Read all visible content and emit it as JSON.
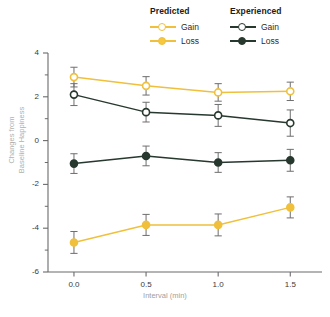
{
  "legend": {
    "groups": [
      {
        "title": "Predicted",
        "color": "#f0c03c",
        "entries": [
          {
            "label": "Gain",
            "marker": "open-circle"
          },
          {
            "label": "Loss",
            "marker": "filled-circle"
          }
        ]
      },
      {
        "title": "Experienced",
        "color": "#27382e",
        "entries": [
          {
            "label": "Gain",
            "marker": "open-circle"
          },
          {
            "label": "Loss",
            "marker": "filled-circle"
          }
        ]
      }
    ]
  },
  "axes": {
    "y": {
      "title_line1": "Changes from",
      "title_line2": "Baseline Happiness",
      "major_ticks": [
        "4",
        "2",
        "0",
        "-2",
        "-4",
        "-6"
      ],
      "major_values": [
        4,
        2,
        0,
        -2,
        -4,
        -6
      ],
      "minor_values": [
        3,
        1,
        -1,
        -3,
        -5
      ],
      "min": -6,
      "max": 4
    },
    "x": {
      "title": "Interval (min)",
      "ticks": [
        "0.0",
        "0.5",
        "1.0",
        "1.5"
      ],
      "values": [
        0.0,
        0.5,
        1.0,
        1.5
      ],
      "min": -0.18,
      "max": 1.72
    }
  },
  "caption": "",
  "chart_data": {
    "type": "line",
    "title": "",
    "xlabel": "Interval (min)",
    "ylabel": "Changes from Baseline Happiness",
    "x": [
      0.0,
      0.5,
      1.0,
      1.5
    ],
    "xlim": [
      -0.18,
      1.72
    ],
    "ylim": [
      -6,
      4
    ],
    "grid": false,
    "legend_position": "top-right",
    "error_bars": "symmetric",
    "series": [
      {
        "name": "Predicted Gain",
        "group": "Predicted",
        "condition": "Gain",
        "color": "#f0c03c",
        "marker": "open-circle",
        "values": [
          2.9,
          2.5,
          2.2,
          2.25
        ],
        "errors": [
          0.45,
          0.42,
          0.4,
          0.42
        ]
      },
      {
        "name": "Predicted Loss",
        "group": "Predicted",
        "condition": "Loss",
        "color": "#f0c03c",
        "marker": "filled-circle",
        "values": [
          -4.65,
          -3.85,
          -3.85,
          -3.05
        ],
        "errors": [
          0.5,
          0.48,
          0.5,
          0.48
        ]
      },
      {
        "name": "Experienced Gain",
        "group": "Experienced",
        "condition": "Gain",
        "color": "#27382e",
        "marker": "open-circle",
        "values": [
          2.1,
          1.3,
          1.15,
          0.8
        ],
        "errors": [
          0.5,
          0.45,
          0.5,
          0.6
        ]
      },
      {
        "name": "Experienced Loss",
        "group": "Experienced",
        "condition": "Loss",
        "color": "#27382e",
        "marker": "filled-circle",
        "values": [
          -1.05,
          -0.7,
          -1.0,
          -0.9
        ],
        "errors": [
          0.45,
          0.45,
          0.45,
          0.5
        ]
      }
    ]
  }
}
